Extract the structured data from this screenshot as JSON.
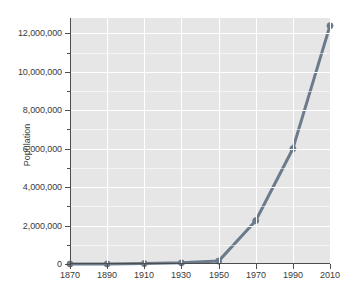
{
  "chart_data": {
    "type": "line",
    "title": "",
    "subtitle": "",
    "xlabel": "",
    "ylabel": "Population",
    "x": [
      1870,
      1890,
      1910,
      1930,
      1950,
      1970,
      1990,
      2010
    ],
    "values": [
      1000,
      5000,
      20000,
      60000,
      150000,
      2250000,
      6000000,
      12400000
    ],
    "series": [
      {
        "name": "Population",
        "values": [
          1000,
          5000,
          20000,
          60000,
          150000,
          2250000,
          6000000,
          12400000
        ]
      }
    ],
    "xlim": [
      1870,
      2010
    ],
    "ylim": [
      0,
      12800000
    ],
    "y_major_ticks": [
      0,
      2000000,
      4000000,
      6000000,
      8000000,
      10000000,
      12000000
    ],
    "y_minor_ticks": [
      1000000,
      3000000,
      5000000,
      7000000,
      9000000,
      11000000
    ],
    "y_tick_labels": [
      "0",
      "2,000,000",
      "4,000,000",
      "6,000,000",
      "8,000,000",
      "10,000,000",
      "12,000,000"
    ],
    "x_ticks": [
      1870,
      1890,
      1910,
      1930,
      1950,
      1970,
      1990,
      2010
    ],
    "x_tick_labels": [
      "1870",
      "1890",
      "1910",
      "1930",
      "1950",
      "1970",
      "1990",
      "2010"
    ],
    "grid": true,
    "grid_color": "#ffffff",
    "plot_background": "#e6e6e6",
    "figure_background": "#ffffff",
    "legend": null,
    "legend_position": "none",
    "annotations": [],
    "line_color": "#6b7b8c",
    "line_width": 3,
    "marker": "circle",
    "marker_size": 3,
    "axis_color": "#4d4d4d"
  }
}
